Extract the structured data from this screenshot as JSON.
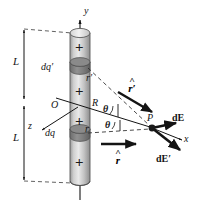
{
  "figure": {
    "background_color": "#ffffff",
    "stroke_color": "#141414",
    "cylinder_fill_light": "#e8e8e8",
    "cylinder_fill_mid": "#bdbdbd",
    "cylinder_fill_dark": "#8f8f8f",
    "disk_fill": "#7a7a7a"
  },
  "labels": {
    "y_axis": "y",
    "z_axis": "z",
    "x_axis": "x",
    "origin": "O",
    "radius": "R",
    "length_upper": "L",
    "length_lower": "L",
    "charge_upper": "dq′",
    "charge_lower": "dq",
    "distance_upper": "r′",
    "distance_lower": "r",
    "unit_vector_upper_hat": "˄",
    "unit_vector_upper_base": "r′",
    "unit_vector_lower_hat": "˄",
    "unit_vector_lower_base": "r",
    "angle_upper": "θ",
    "angle_lower": "θ",
    "point": "P",
    "field_upper": "dE",
    "field_lower": "dE′"
  },
  "charges": {
    "plus_symbol": "+",
    "count": 4,
    "positions_y": [
      46,
      90,
      122,
      163
    ]
  },
  "geometry": {
    "cylinder_x_left": 70,
    "cylinder_x_right": 90,
    "cylinder_top_y": 29,
    "cylinder_bottom_y": 185,
    "origin_x": 80,
    "origin_y": 105,
    "point_P_x": 152,
    "point_P_y": 128,
    "disk_upper_y": 66,
    "disk_lower_y": 133
  }
}
